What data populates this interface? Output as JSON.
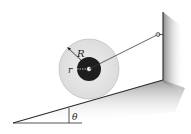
{
  "diagram": {
    "labels": {
      "outer_radius": "R",
      "inner_radius": "r",
      "incline_angle": "θ"
    },
    "colors": {
      "outer_disk": "#e6e6e6",
      "inner_hub": "#1e1e1e",
      "incline_shade": "#9a9a9a",
      "wall_shade": "#8a8a8a",
      "line": "#2a2a2a"
    }
  }
}
